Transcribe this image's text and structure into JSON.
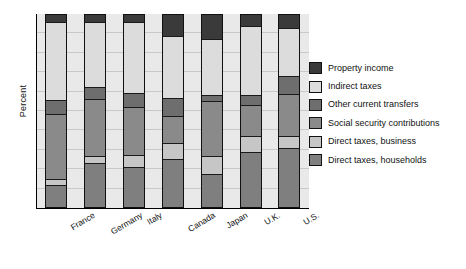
{
  "chart_data": {
    "type": "bar",
    "title": "",
    "subtitle": "",
    "xlabel": "",
    "ylabel": "Percent",
    "stacked": true,
    "grid": true,
    "grid_interval": 10,
    "ylim": [
      0,
      100
    ],
    "y_tick_labels": [],
    "legend_position": "right",
    "categories": [
      "France",
      "Germany",
      "Italy",
      "Canada",
      "Japan",
      "U.K.",
      "U.S."
    ],
    "series": [
      {
        "name": "Direct taxes, households",
        "color": "#7f7f7f",
        "values": [
          11,
          23,
          21,
          25,
          17,
          29,
          31
        ]
      },
      {
        "name": "Direct taxes, business",
        "color": "#c6c6c6",
        "values": [
          3,
          3,
          6,
          8,
          9,
          8,
          6
        ]
      },
      {
        "name": "Social security contributions",
        "color": "#8a8a8a",
        "values": [
          34,
          30,
          25,
          14,
          29,
          16,
          22
        ]
      },
      {
        "name": "Other current transfers",
        "color": "#6e6e6e",
        "values": [
          7,
          6,
          7,
          9,
          3,
          5,
          9
        ]
      },
      {
        "name": "Indirect taxes",
        "color": "#dcdcdc",
        "values": [
          41,
          34,
          37,
          33,
          29,
          36,
          25
        ]
      },
      {
        "name": "Property income",
        "color": "#3a3a3a",
        "values": [
          4,
          4,
          4,
          11,
          13,
          6,
          7
        ]
      }
    ]
  },
  "legend": {
    "items": [
      {
        "label": "Property income",
        "color": "#3a3a3a"
      },
      {
        "label": "Indirect taxes",
        "color": "#dcdcdc"
      },
      {
        "label": "Other current transfers",
        "color": "#6e6e6e"
      },
      {
        "label": "Social security contributions",
        "color": "#8a8a8a"
      },
      {
        "label": "Direct taxes, business",
        "color": "#c6c6c6"
      },
      {
        "label": "Direct taxes, households",
        "color": "#7f7f7f"
      }
    ]
  }
}
